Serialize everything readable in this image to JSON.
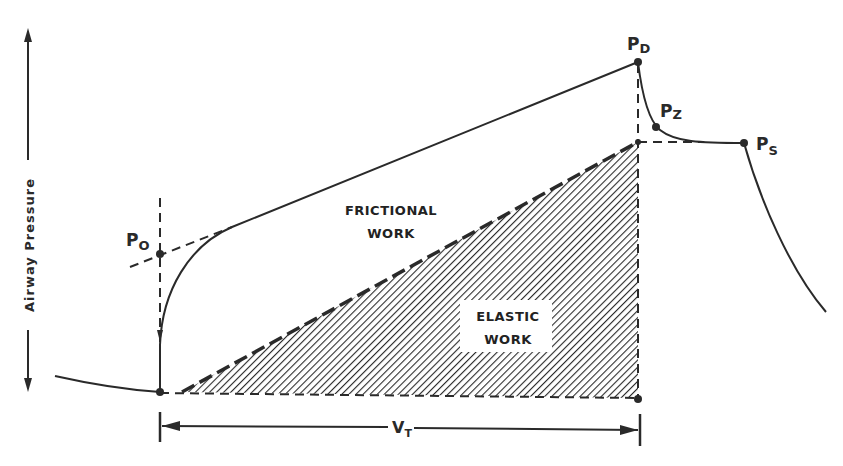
{
  "diagram": {
    "type": "pressure-volume work diagram",
    "axis": {
      "y_label": "Airway Pressure",
      "x_dimension_label": "V",
      "x_dimension_subscript": "T"
    },
    "points": [
      {
        "id": "p0",
        "label": "P",
        "subscript": "O"
      },
      {
        "id": "pd",
        "label": "P",
        "subscript": "D"
      },
      {
        "id": "pz",
        "label": "P",
        "subscript": "Z"
      },
      {
        "id": "ps",
        "label": "P",
        "subscript": "S"
      }
    ],
    "regions": {
      "frictional": {
        "line1": "FRICTIONAL",
        "line2": "WORK"
      },
      "elastic": {
        "line1": "ELASTIC",
        "line2": "WORK"
      }
    },
    "colors": {
      "ink": "#2a2a2a",
      "background": "#ffffff"
    }
  }
}
